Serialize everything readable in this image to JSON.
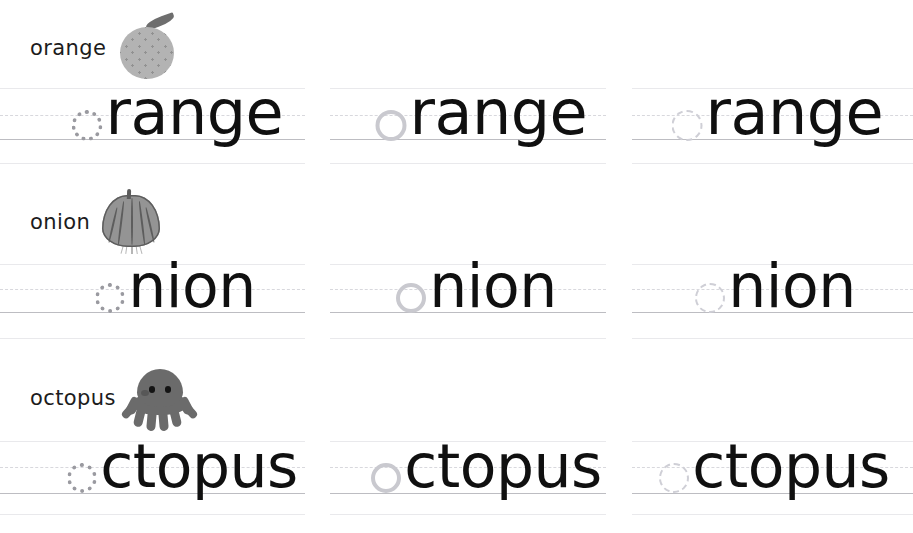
{
  "page": {
    "background_color": "#ffffff",
    "ink_color": "#101010",
    "rule_color": "#bdbdc2",
    "rule_faint_color": "#e9e9ec",
    "rule_dashed_color": "#d8d8dd",
    "art_color": "#6b6b6b"
  },
  "rows": [
    {
      "label": "orange",
      "picture": "orange-icon",
      "word": "orange",
      "lead_letter": "o",
      "rest": "range",
      "columns": [
        {
          "trace_style": "dotted-strong"
        },
        {
          "trace_style": "solid-light"
        },
        {
          "trace_style": "dashed-faint"
        }
      ]
    },
    {
      "label": "onion",
      "picture": "onion-icon",
      "word": "onion",
      "lead_letter": "o",
      "rest": "nion",
      "columns": [
        {
          "trace_style": "dotted-strong"
        },
        {
          "trace_style": "solid-light"
        },
        {
          "trace_style": "dashed-faint"
        }
      ]
    },
    {
      "label": "octopus",
      "picture": "octopus-icon",
      "word": "octopus",
      "lead_letter": "o",
      "rest": "ctopus",
      "columns": [
        {
          "trace_style": "dotted-strong"
        },
        {
          "trace_style": "solid-light"
        },
        {
          "trace_style": "dashed-faint"
        }
      ]
    }
  ]
}
